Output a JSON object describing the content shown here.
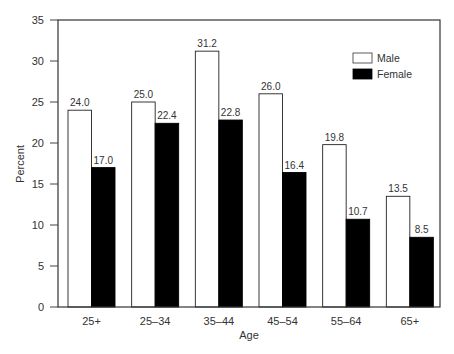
{
  "chart_data": {
    "type": "bar",
    "title": "",
    "xlabel": "Age",
    "ylabel": "Percent",
    "ylim": [
      0,
      35
    ],
    "yticks": [
      0,
      5,
      10,
      15,
      20,
      25,
      30,
      35
    ],
    "grid": false,
    "legend_position": "upper right (inside plot)",
    "categories": [
      "25+",
      "25–34",
      "35–44",
      "45–54",
      "55–64",
      "65+"
    ],
    "series": [
      {
        "name": "Male",
        "color": "#ffffff",
        "stroke": "#222222",
        "values": [
          24.0,
          25.0,
          31.2,
          26.0,
          19.8,
          13.5
        ],
        "labels": [
          "24.0",
          "25.0",
          "31.2",
          "26.0",
          "19.8",
          "13.5"
        ]
      },
      {
        "name": "Female",
        "color": "#000000",
        "stroke": "#000000",
        "values": [
          17.0,
          22.4,
          22.8,
          16.4,
          10.7,
          8.5
        ],
        "labels": [
          "17.0",
          "22.4",
          "22.8",
          "16.4",
          "10.7",
          "8.5"
        ]
      }
    ]
  },
  "legend": {
    "items": [
      {
        "label": "Male"
      },
      {
        "label": "Female"
      }
    ]
  },
  "axes": {
    "x_title": "Age",
    "y_title": "Percent"
  }
}
